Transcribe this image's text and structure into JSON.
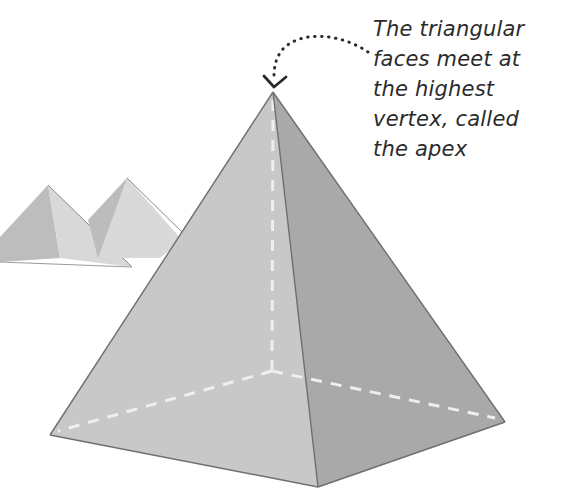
{
  "diagram": {
    "annotation": {
      "lines": [
        "The triangular",
        "faces meet at",
        "the highest",
        "vertex, called",
        "the apex"
      ],
      "points_to": "apex"
    },
    "colors": {
      "left_face": "#c9c9c9",
      "right_face": "#a8a8a8",
      "edge": "#6e6e6e",
      "hidden_edge": "#eeeeee",
      "text": "#2b2b2b",
      "background_pyramids": "#d6d6d6"
    }
  }
}
